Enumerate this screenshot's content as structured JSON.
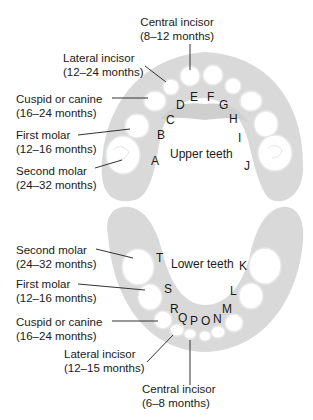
{
  "colors": {
    "gum": "#d9d9d9",
    "tooth": "#ffffff",
    "tooth_outline": "#e6e6e6",
    "text": "#1a1a1a",
    "leader": "#333333"
  },
  "upper": {
    "arch_label": "Upper teeth",
    "letters": [
      "A",
      "B",
      "C",
      "D",
      "E",
      "F",
      "G",
      "H",
      "I",
      "J"
    ],
    "callouts": [
      {
        "name": "Central incisor",
        "age": "(8–12 months)"
      },
      {
        "name": "Lateral incisor",
        "age": "(12–24 months)"
      },
      {
        "name": "Cuspid or canine",
        "age": "(16–24 months)"
      },
      {
        "name": "First molar",
        "age": "(12–16 months)"
      },
      {
        "name": "Second molar",
        "age": "(24–32 months)"
      }
    ]
  },
  "lower": {
    "arch_label": "Lower teeth",
    "letters": [
      "K",
      "L",
      "M",
      "N",
      "O",
      "P",
      "Q",
      "R",
      "S",
      "T"
    ],
    "callouts": [
      {
        "name": "Second molar",
        "age": "(24–32 months)"
      },
      {
        "name": "First molar",
        "age": "(12–16 months)"
      },
      {
        "name": "Cuspid or canine",
        "age": "(16–24 months)"
      },
      {
        "name": "Lateral incisor",
        "age": "(12–15 months)"
      },
      {
        "name": "Central incisor",
        "age": "(6–8 months)"
      }
    ]
  }
}
